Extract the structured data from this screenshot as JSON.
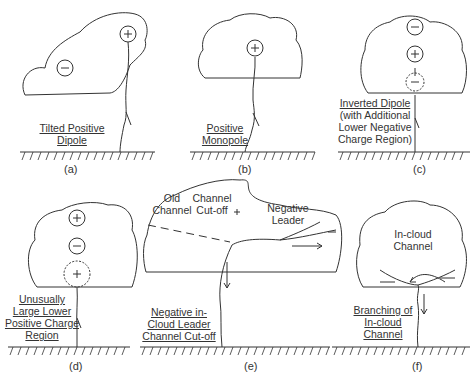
{
  "panels": [
    {
      "id": "a",
      "caption": "(a)",
      "title_lines": [
        "Tilted Positive",
        "Dipole"
      ],
      "charges": [
        "+",
        "−"
      ]
    },
    {
      "id": "b",
      "caption": "(b)",
      "title_lines": [
        "Positive",
        "Monopole"
      ],
      "charges": [
        "+"
      ]
    },
    {
      "id": "c",
      "caption": "(c)",
      "title_lines": [
        "Inverted Dipole",
        "(with Additional",
        "Lower Negative",
        "Charge Region)"
      ],
      "charges": [
        "−",
        "+",
        "−"
      ]
    },
    {
      "id": "d",
      "caption": "(d)",
      "title_lines": [
        "Unusually",
        "Large Lower",
        "Positive Charge",
        "Region"
      ],
      "charges": [
        "+",
        "−",
        "+"
      ]
    },
    {
      "id": "e",
      "caption": "(e)",
      "title_lines": [
        "Negative in-",
        "Cloud Leader",
        "Channel Cut-off"
      ],
      "annotations": [
        "Old Channel",
        "Channel Cut-off",
        "Negative Leader"
      ],
      "charges": [
        "+",
        "−"
      ]
    },
    {
      "id": "f",
      "caption": "(f)",
      "title_lines": [
        "Branching of",
        "In-cloud",
        "Channel"
      ],
      "annotations": [
        "In-cloud Channel"
      ]
    }
  ],
  "e_notes": {
    "old1": "Old",
    "old2": "Channel",
    "cut1": "Channel",
    "cut2": "Cut-off",
    "neg1": "Negative",
    "neg2": "Leader"
  },
  "f_notes": {
    "in1": "In-cloud",
    "in2": "Channel"
  }
}
